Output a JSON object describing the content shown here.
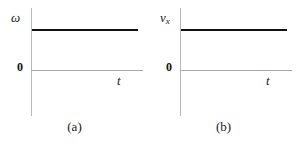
{
  "figure": {
    "background_color": "#ffffff",
    "panels": [
      {
        "caption": "(a)",
        "ylabel": "ω",
        "ylabel_sub": "",
        "xlabel": "t",
        "origin_label": "0"
      },
      {
        "caption": "(b)",
        "ylabel": "v",
        "ylabel_sub": "x",
        "xlabel": "t",
        "origin_label": "0"
      }
    ]
  },
  "chart_data": [
    {
      "type": "line",
      "title": "(a)",
      "xlabel": "t",
      "ylabel": "ω",
      "grid": false,
      "legend": false,
      "axis_origin_label": "0",
      "xlim": [
        0,
        1
      ],
      "ylim": [
        0,
        1
      ],
      "series": [
        {
          "name": "ω",
          "x": [
            0,
            1
          ],
          "values": [
            0.66,
            0.66
          ],
          "style": "solid",
          "color": "#111111",
          "linewidth": 2,
          "description": "constant positive angular velocity, horizontal line above the t-axis"
        }
      ]
    },
    {
      "type": "line",
      "title": "(b)",
      "xlabel": "t",
      "ylabel": "v_x",
      "grid": false,
      "legend": false,
      "axis_origin_label": "0",
      "xlim": [
        0,
        1
      ],
      "ylim": [
        0,
        1
      ],
      "series": [
        {
          "name": "v_x",
          "x": [
            0,
            1
          ],
          "values": [
            0.66,
            0.66
          ],
          "style": "solid",
          "color": "#111111",
          "linewidth": 2,
          "description": "constant positive x-velocity, horizontal line above the t-axis"
        }
      ]
    }
  ]
}
